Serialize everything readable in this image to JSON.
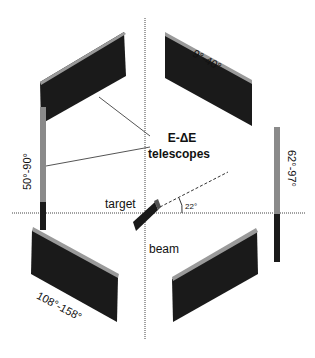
{
  "diagram": {
    "title_labels": {
      "telescopes_line1": "E-ΔE",
      "telescopes_line2": "telescopes",
      "target": "target",
      "beam": "beam",
      "angle": "22°"
    },
    "detectors": [
      {
        "id": "top-left",
        "label": ""
      },
      {
        "id": "top-right",
        "label": "9°-40°"
      },
      {
        "id": "left-vertical",
        "label": "50°-90°"
      },
      {
        "id": "right-vertical",
        "label": "62°-97°"
      },
      {
        "id": "bottom-left",
        "label": "108°-158°"
      },
      {
        "id": "bottom-right",
        "label": ""
      }
    ],
    "colors": {
      "detector_dark": "#1a1a1a",
      "detector_edge": "#9a9a9a",
      "line": "#333333"
    }
  }
}
